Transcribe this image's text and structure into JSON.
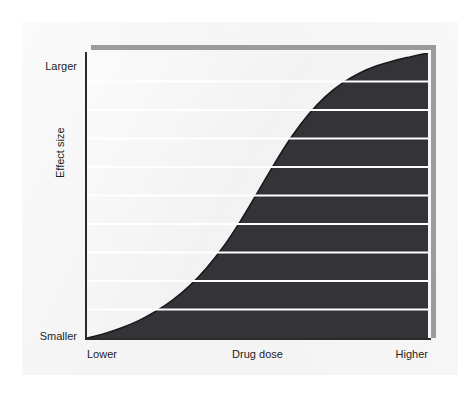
{
  "figure": {
    "name": "drug-dose-response-curve",
    "background_color": "#f4f4f4",
    "plot_background_color": "#f2f2f2",
    "frame_color": "#9b9b9b",
    "axis_color": "#2a2a2a"
  },
  "axes": {
    "y": {
      "label": "Effect size",
      "tick_top": "Larger",
      "tick_bottom": "Smaller"
    },
    "x": {
      "label": "Drug dose",
      "tick_left": "Lower",
      "tick_right": "Higher"
    }
  },
  "chart_data": {
    "type": "area",
    "title": "",
    "subtitle": "",
    "xlabel": "Drug dose",
    "ylabel": "Effect size",
    "xlim": [
      0,
      1
    ],
    "ylim": [
      0,
      1
    ],
    "xtick_labels": [
      "Lower",
      "Higher"
    ],
    "ytick_labels": [
      "Smaller",
      "Larger"
    ],
    "grid": true,
    "grid_orientation": "horizontal",
    "grid_count": 10,
    "grid_color": "#ffffff",
    "grid_values": [
      0.1,
      0.2,
      0.3,
      0.4,
      0.5,
      0.6,
      0.7,
      0.8,
      0.9,
      1.0
    ],
    "legend": null,
    "legend_position": "none",
    "series": [
      {
        "name": "Dose-response",
        "shape": "sigmoid",
        "fill_color": "#333338",
        "line_color": "#1a1a1a",
        "line_width": 1.6,
        "inflection_x": 0.55,
        "x": [
          0.0,
          0.05,
          0.1,
          0.15,
          0.2,
          0.25,
          0.3,
          0.35,
          0.4,
          0.45,
          0.5,
          0.55,
          0.6,
          0.65,
          0.7,
          0.75,
          0.8,
          0.85,
          0.9,
          0.95,
          1.0
        ],
        "y": [
          0.0,
          0.015,
          0.035,
          0.06,
          0.092,
          0.132,
          0.182,
          0.245,
          0.32,
          0.41,
          0.51,
          0.612,
          0.706,
          0.785,
          0.848,
          0.895,
          0.93,
          0.955,
          0.973,
          0.987,
          1.0
        ]
      }
    ],
    "annotations": []
  }
}
